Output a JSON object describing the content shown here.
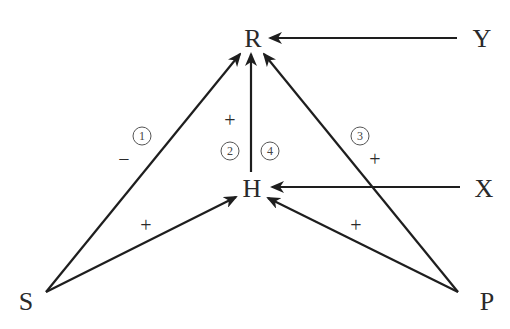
{
  "diagram": {
    "nodes": [
      {
        "id": "R",
        "label": "R",
        "x": 253,
        "y": 48
      },
      {
        "id": "Y",
        "label": "Y",
        "x": 482,
        "y": 48
      },
      {
        "id": "H",
        "label": "H",
        "x": 252,
        "y": 198
      },
      {
        "id": "X",
        "label": "X",
        "x": 484,
        "y": 198
      },
      {
        "id": "S",
        "label": "S",
        "x": 26,
        "y": 310
      },
      {
        "id": "P",
        "label": "P",
        "x": 487,
        "y": 310
      }
    ],
    "edges": [
      {
        "from": "Y",
        "to": "R",
        "sign": "",
        "number": ""
      },
      {
        "from": "S",
        "to": "R",
        "sign": "−",
        "number": "1"
      },
      {
        "from": "H",
        "to": "R",
        "sign": "+",
        "number": "2 / 4"
      },
      {
        "from": "P",
        "to": "R",
        "sign": "+",
        "number": "3"
      },
      {
        "from": "X",
        "to": "H",
        "sign": "",
        "number": ""
      },
      {
        "from": "S",
        "to": "H",
        "sign": "+",
        "number": ""
      },
      {
        "from": "P",
        "to": "H",
        "sign": "+",
        "number": ""
      }
    ],
    "labels": {
      "sign_SR": "−",
      "sign_HR": "+",
      "sign_PR": "+",
      "sign_SH": "+",
      "sign_PH": "+",
      "num_1": "1",
      "num_2": "2",
      "num_3": "3",
      "num_4": "4"
    }
  }
}
